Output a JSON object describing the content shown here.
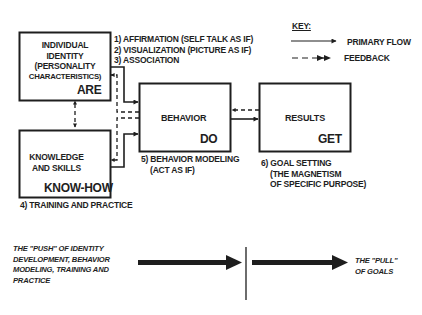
{
  "boxes": {
    "identity": {
      "title_lines": [
        "INDIVIDUAL",
        "IDENTITY",
        "(PERSONALITY",
        "CHARACTERISTICS)"
      ],
      "verb": "ARE"
    },
    "knowledge": {
      "title_lines": [
        "KNOWLEDGE",
        "AND SKILLS"
      ],
      "verb": "KNOW-HOW"
    },
    "behavior": {
      "title": "BEHAVIOR",
      "verb": "DO"
    },
    "results": {
      "title": "RESULTS",
      "verb": "GET"
    }
  },
  "annotations": {
    "identity_methods": [
      "1) AFFIRMATION (SELF TALK AS IF)",
      "2) VISUALIZATION (PICTURE AS IF)",
      "3) ASSOCIATION"
    ],
    "knowledge_method": "4) TRAINING AND PRACTICE",
    "behavior_method": [
      "5) BEHAVIOR MODELING",
      "(ACT AS IF)"
    ],
    "results_method": [
      "6) GOAL SETTING",
      "(THE MAGNETISM",
      "OF SPECIFIC PURPOSE)"
    ]
  },
  "key": {
    "title": "KEY:",
    "items": [
      {
        "label": "PRIMARY FLOW",
        "style": "solid"
      },
      {
        "label": "FEEDBACK",
        "style": "dashed"
      }
    ]
  },
  "push_pull": {
    "push_lines": [
      "THE \"PUSH\" OF IDENTITY",
      "DEVELOPMENT, BEHAVIOR",
      "MODELING, TRAINING AND",
      "PRACTICE"
    ],
    "pull_lines": [
      "THE \"PULL\"",
      "OF GOALS"
    ]
  },
  "colors": {
    "ink": "#1e1e1e",
    "background": "#ffffff"
  }
}
